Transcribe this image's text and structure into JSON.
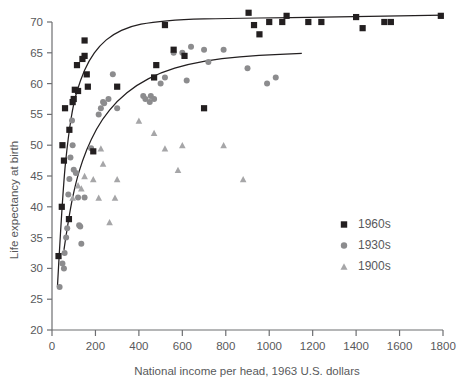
{
  "chart_data": {
    "type": "scatter",
    "title": "",
    "xlabel": "National income per head, 1963 U.S. dollars",
    "ylabel": "Life expectancy at birth",
    "xlim": [
      0,
      1800
    ],
    "ylim": [
      20,
      70
    ],
    "xticks": [
      0,
      200,
      400,
      600,
      800,
      1000,
      1200,
      1400,
      1600,
      1800
    ],
    "yticks": [
      20,
      25,
      30,
      35,
      40,
      45,
      50,
      55,
      60,
      65,
      70
    ],
    "grid": false,
    "legend_position": "right-middle",
    "series": [
      {
        "name": "1960s",
        "marker": "square",
        "color": "#231f20",
        "points": [
          [
            30,
            32.0
          ],
          [
            45,
            40.0
          ],
          [
            55,
            47.5
          ],
          [
            48,
            50.0
          ],
          [
            60,
            56.0
          ],
          [
            78,
            38.0
          ],
          [
            80,
            52.5
          ],
          [
            95,
            57.0
          ],
          [
            100,
            57.5
          ],
          [
            105,
            59.0
          ],
          [
            115,
            63.0
          ],
          [
            120,
            58.8
          ],
          [
            150,
            64.5
          ],
          [
            150,
            67.0
          ],
          [
            140,
            64.0
          ],
          [
            160,
            61.5
          ],
          [
            165,
            59.5
          ],
          [
            190,
            49.0
          ],
          [
            300,
            59.5
          ],
          [
            470,
            61.0
          ],
          [
            480,
            63.0
          ],
          [
            520,
            69.5
          ],
          [
            560,
            65.5
          ],
          [
            610,
            64.5
          ],
          [
            700,
            56.0
          ],
          [
            905,
            71.5
          ],
          [
            930,
            69.5
          ],
          [
            955,
            68.0
          ],
          [
            1000,
            70.0
          ],
          [
            1060,
            70.0
          ],
          [
            1080,
            71.0
          ],
          [
            1180,
            70.0
          ],
          [
            1240,
            70.0
          ],
          [
            1400,
            70.8
          ],
          [
            1430,
            69.0
          ],
          [
            1530,
            70.0
          ],
          [
            1560,
            70.0
          ],
          [
            1790,
            71.0
          ]
        ]
      },
      {
        "name": "1930s",
        "marker": "circle",
        "color": "#8c8c8e",
        "points": [
          [
            35,
            27.0
          ],
          [
            48,
            30.8
          ],
          [
            55,
            30.0
          ],
          [
            58,
            32.5
          ],
          [
            65,
            35.0
          ],
          [
            70,
            36.5
          ],
          [
            75,
            42.0
          ],
          [
            80,
            44.5
          ],
          [
            85,
            48.0
          ],
          [
            92,
            54.0
          ],
          [
            95,
            50.0
          ],
          [
            100,
            46.0
          ],
          [
            110,
            45.5
          ],
          [
            120,
            41.5
          ],
          [
            125,
            37.0
          ],
          [
            130,
            36.8
          ],
          [
            135,
            34.0
          ],
          [
            150,
            41.5
          ],
          [
            180,
            49.5
          ],
          [
            215,
            55.0
          ],
          [
            225,
            56.0
          ],
          [
            235,
            57.0
          ],
          [
            240,
            56.8
          ],
          [
            260,
            57.5
          ],
          [
            280,
            61.5
          ],
          [
            300,
            56.0
          ],
          [
            420,
            58.0
          ],
          [
            430,
            57.5
          ],
          [
            450,
            57.0
          ],
          [
            455,
            58.0
          ],
          [
            470,
            57.5
          ],
          [
            500,
            60.0
          ],
          [
            520,
            61.0
          ],
          [
            560,
            65.0
          ],
          [
            600,
            65.0
          ],
          [
            620,
            60.5
          ],
          [
            640,
            66.0
          ],
          [
            700,
            65.5
          ],
          [
            720,
            63.5
          ],
          [
            790,
            65.5
          ],
          [
            900,
            62.5
          ],
          [
            990,
            60.0
          ],
          [
            1030,
            61.0
          ]
        ]
      },
      {
        "name": "1900s",
        "marker": "triangle",
        "color": "#a6a6a8",
        "points": [
          [
            95,
            41.5
          ],
          [
            120,
            43.5
          ],
          [
            135,
            43.0
          ],
          [
            150,
            45.0
          ],
          [
            190,
            44.5
          ],
          [
            215,
            41.5
          ],
          [
            225,
            49.5
          ],
          [
            235,
            47.0
          ],
          [
            265,
            37.5
          ],
          [
            290,
            41.5
          ],
          [
            300,
            44.5
          ],
          [
            400,
            54.0
          ],
          [
            470,
            52.0
          ],
          [
            520,
            49.5
          ],
          [
            580,
            46.0
          ],
          [
            600,
            50.0
          ],
          [
            790,
            50.0
          ],
          [
            880,
            44.5
          ]
        ]
      }
    ],
    "fit_curves": [
      {
        "series": "1960s",
        "description": "rising saturating curve from (25,27) flattening near 71",
        "points": [
          [
            25,
            27.0
          ],
          [
            50,
            43.0
          ],
          [
            75,
            51.5
          ],
          [
            100,
            57.0
          ],
          [
            130,
            60.5
          ],
          [
            170,
            63.8
          ],
          [
            220,
            66.2
          ],
          [
            280,
            68.0
          ],
          [
            360,
            69.3
          ],
          [
            460,
            70.0
          ],
          [
            600,
            70.4
          ],
          [
            800,
            70.6
          ],
          [
            1100,
            70.7
          ],
          [
            1400,
            70.9
          ],
          [
            1800,
            71.1
          ]
        ]
      },
      {
        "series": "1930s",
        "description": "rising saturating curve from (55,33) flattening near 65 at 1150",
        "points": [
          [
            55,
            33.0
          ],
          [
            80,
            39.0
          ],
          [
            110,
            44.0
          ],
          [
            140,
            47.5
          ],
          [
            180,
            51.0
          ],
          [
            230,
            54.2
          ],
          [
            300,
            57.2
          ],
          [
            390,
            59.8
          ],
          [
            500,
            61.8
          ],
          [
            630,
            63.2
          ],
          [
            780,
            64.1
          ],
          [
            950,
            64.6
          ],
          [
            1150,
            64.9
          ]
        ]
      }
    ]
  },
  "axis": {
    "y_title": "Life expectancy at birth",
    "x_title": "National income per head, 1963 U.S. dollars",
    "xticks": [
      "0",
      "200",
      "400",
      "600",
      "800",
      "1000",
      "1200",
      "1400",
      "1600",
      "1800"
    ],
    "yticks": [
      "70",
      "65",
      "60",
      "55",
      "50",
      "45",
      "40",
      "35",
      "30",
      "25",
      "20"
    ]
  },
  "legend": {
    "items": [
      {
        "label": "1960s",
        "marker": "square",
        "color": "#231f20"
      },
      {
        "label": "1930s",
        "marker": "circle",
        "color": "#8c8c8e"
      },
      {
        "label": "1900s",
        "marker": "triangle",
        "color": "#a6a6a8"
      }
    ]
  }
}
